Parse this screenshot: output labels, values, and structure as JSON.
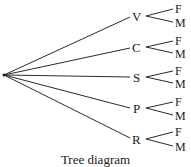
{
  "caption": "Tree diagram",
  "root": {
    "x": 4,
    "y": 75
  },
  "first_level": [
    {
      "label": "V",
      "x": 134,
      "y": 16,
      "children": [
        {
          "label": "F",
          "y": 9
        },
        {
          "label": "M",
          "y": 22
        }
      ]
    },
    {
      "label": "C",
      "x": 134,
      "y": 47,
      "children": [
        {
          "label": "F",
          "y": 41
        },
        {
          "label": "M",
          "y": 53
        }
      ]
    },
    {
      "label": "S",
      "x": 134,
      "y": 77,
      "children": [
        {
          "label": "F",
          "y": 71
        },
        {
          "label": "M",
          "y": 83
        }
      ]
    },
    {
      "label": "P",
      "x": 134,
      "y": 108,
      "children": [
        {
          "label": "F",
          "y": 102
        },
        {
          "label": "M",
          "y": 115
        }
      ]
    },
    {
      "label": "R",
      "x": 134,
      "y": 139,
      "children": [
        {
          "label": "F",
          "y": 132
        },
        {
          "label": "M",
          "y": 146
        }
      ]
    }
  ]
}
